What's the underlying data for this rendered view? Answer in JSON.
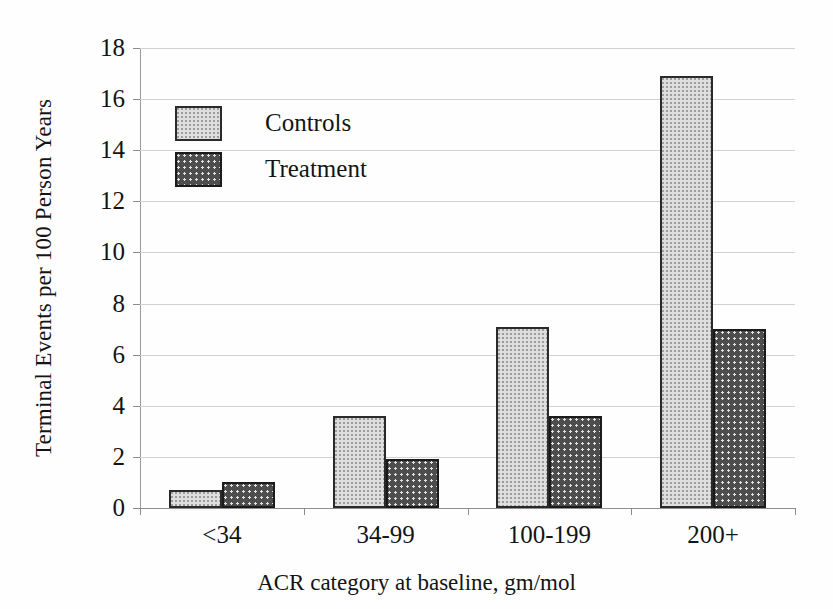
{
  "chart_data": {
    "type": "bar",
    "title": "",
    "subtitle": "",
    "xlabel": "ACR category at baseline, gm/mol",
    "ylabel": "Terminal Events per 100 Person Years",
    "categories": [
      "<34",
      "34-99",
      "100-199",
      "200+"
    ],
    "series": [
      {
        "name": "Controls",
        "values": [
          0.7,
          3.6,
          7.1,
          16.9
        ],
        "color": "#dedede"
      },
      {
        "name": "Treatment",
        "values": [
          1.0,
          1.9,
          3.6,
          7.0
        ],
        "color": "#4d4d4d"
      }
    ],
    "ylim": [
      0,
      18
    ],
    "ytick_labels": [
      "18",
      "16",
      "14",
      "12",
      "10",
      "8",
      "6",
      "4",
      "2",
      "0"
    ],
    "ytick_values": [
      18,
      16,
      14,
      12,
      10,
      8,
      6,
      4,
      2,
      0
    ],
    "ytick_step": 2,
    "grid": true,
    "grid_axis": "y",
    "legend_position": "upper-left-inside",
    "legend_entries": [
      "Controls",
      "Treatment"
    ],
    "bar_group_count": 4,
    "orientation": "vertical"
  }
}
